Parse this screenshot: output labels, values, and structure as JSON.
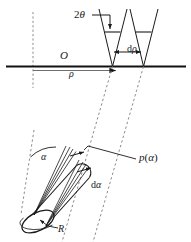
{
  "figure": {
    "type": "technical-line-diagram",
    "background_color": "#ffffff",
    "line_color": "#1a1a1a",
    "dashed_color": "#8c8c8c",
    "width": 191,
    "height": 242
  },
  "labels": {
    "two_theta": "2θ",
    "d_rho": "dρ",
    "origin": "O",
    "rho": "ρ",
    "p_alpha": "p(α)",
    "d_alpha": "dα",
    "alpha": "α",
    "radius": "R"
  },
  "label_parts": {
    "d_rho_prefix": "d",
    "d_rho_symbol": "ρ",
    "d_alpha_prefix": "d",
    "d_alpha_symbol": "α",
    "two_theta_number": "2",
    "two_theta_symbol": "θ",
    "p_name": "p",
    "p_open": "(",
    "p_arg": "α",
    "p_close": ")"
  },
  "elements": {
    "horizontal_axis": "detector-axis",
    "vertical_dashed_reference": "origin-reference-line",
    "left_wedge": "scattering-cone-left",
    "right_wedge": "scattering-cone-right",
    "dashed_ray_1": "projection-ray-inner",
    "dashed_ray_2": "projection-ray-outer",
    "cylinder": "fiber-cylinder",
    "cylinder_cap": "fiber-end-ellipse",
    "alpha_arc": "alpha-angle-arc",
    "alpha_axis_dashed": "fiber-axis-reference",
    "leader_p_alpha": "p-alpha-leader-line",
    "leader_two_theta": "two-theta-leader-arrow",
    "leader_R": "radius-leader-arrow"
  }
}
